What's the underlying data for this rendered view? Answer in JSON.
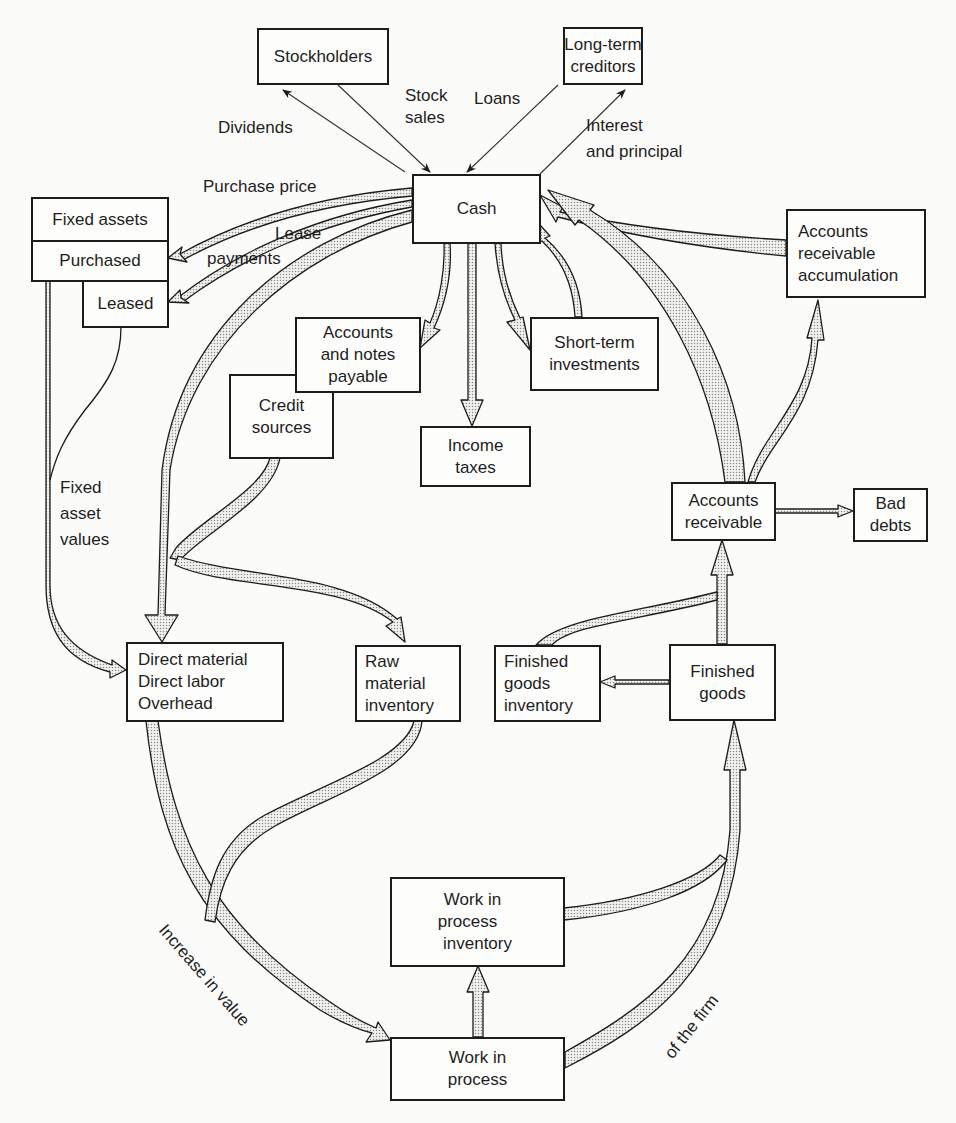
{
  "diagram": {
    "nodes": {
      "stockholders": {
        "lines": [
          "Stockholders"
        ]
      },
      "long_term_creditors": {
        "lines": [
          "Long-term",
          "creditors"
        ]
      },
      "cash": {
        "lines": [
          "Cash"
        ]
      },
      "fixed_assets": {
        "lines": [
          "Fixed assets"
        ]
      },
      "purchased": {
        "lines": [
          "Purchased"
        ]
      },
      "leased": {
        "lines": [
          "Leased"
        ]
      },
      "accounts_notes_payable": {
        "lines": [
          "Accounts",
          "and notes",
          "payable"
        ]
      },
      "credit_sources": {
        "lines": [
          "Credit",
          "sources"
        ]
      },
      "income_taxes": {
        "lines": [
          "Income",
          "taxes"
        ]
      },
      "short_term_investments": {
        "lines": [
          "Short-term",
          "investments"
        ]
      },
      "ar_accumulation": {
        "lines": [
          "Accounts",
          "receivable",
          "accumulation"
        ]
      },
      "accounts_receivable": {
        "lines": [
          "Accounts",
          "receivable"
        ]
      },
      "bad_debts": {
        "lines": [
          "Bad",
          "debts"
        ]
      },
      "direct_costs": {
        "lines": [
          "Direct material",
          "Direct labor",
          "Overhead"
        ]
      },
      "raw_material_inventory": {
        "lines": [
          "Raw",
          "material",
          "inventory"
        ]
      },
      "finished_goods_inventory": {
        "lines": [
          "Finished",
          "goods",
          "inventory"
        ]
      },
      "finished_goods": {
        "lines": [
          "Finished",
          "goods"
        ]
      },
      "wip_inventory": {
        "lines": [
          "Work in",
          "process",
          "inventory"
        ]
      },
      "work_in_process": {
        "lines": [
          "Work in",
          "process"
        ]
      }
    },
    "edge_labels": {
      "dividends": "Dividends",
      "stock_sales_1": "Stock",
      "stock_sales_2": "sales",
      "loans": "Loans",
      "interest_1": "Interest",
      "interest_2": "and principal",
      "purchase_price": "Purchase price",
      "lease_payments_1": "Lease",
      "lease_payments_2": "payments",
      "fixed_asset_values_1": "Fixed",
      "fixed_asset_values_2": "asset",
      "fixed_asset_values_3": "values",
      "increase_in_value": "Increase in value",
      "of_the_firm": "of the firm"
    },
    "colors": {
      "stroke": "#1c1c1c",
      "flow_fill": "#dcdcd6",
      "background": "#fbfbf9"
    }
  }
}
